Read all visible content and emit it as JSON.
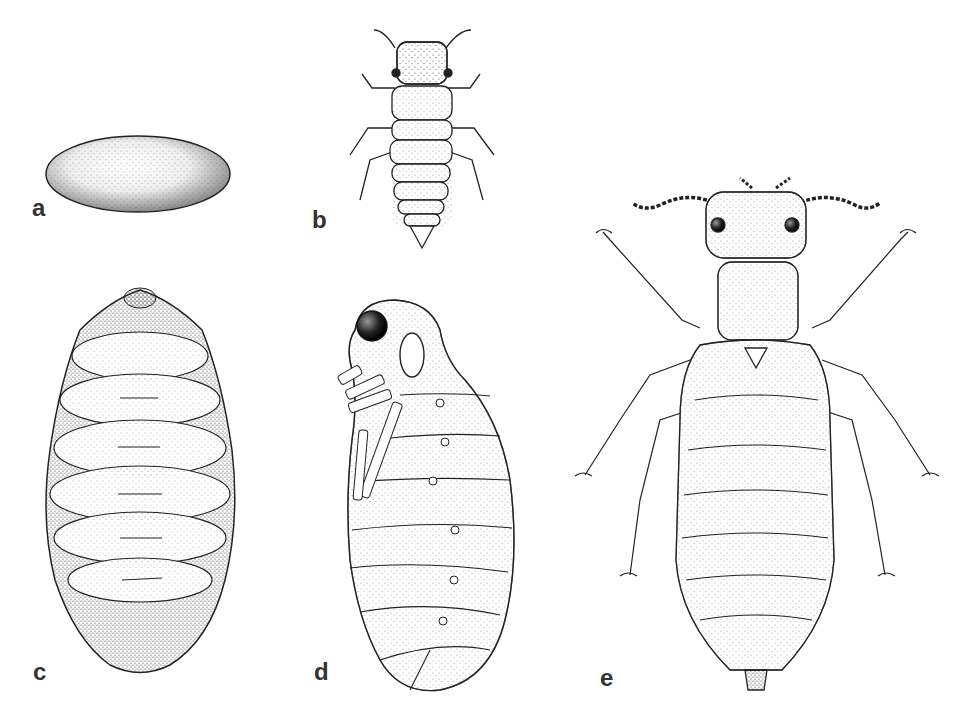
{
  "figure": {
    "type": "scientific-illustration",
    "panels": [
      {
        "id": "a",
        "label": "a",
        "depicts": "egg"
      },
      {
        "id": "b",
        "label": "b",
        "depicts": "larva (dorsal view)"
      },
      {
        "id": "c",
        "label": "c",
        "depicts": "pupal case / cocoon (dorsal view)"
      },
      {
        "id": "d",
        "label": "d",
        "depicts": "pupa (lateral view)"
      },
      {
        "id": "e",
        "label": "e",
        "depicts": "adult (dorsal view)"
      }
    ],
    "colors": {
      "ink": "#222222",
      "background": "#ffffff",
      "stipple": "#555555"
    }
  }
}
